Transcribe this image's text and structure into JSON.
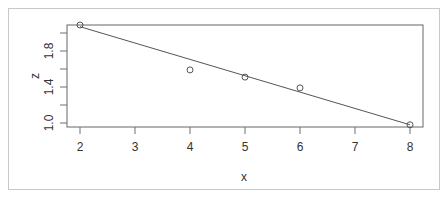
{
  "chart_data": {
    "type": "scatter",
    "title": "",
    "xlabel": "x",
    "ylabel": "z",
    "xlim": [
      1.76,
      8.24
    ],
    "ylim": [
      0.96,
      2.09
    ],
    "x_ticks": [
      2,
      3,
      4,
      5,
      6,
      7,
      8
    ],
    "x_tick_labels": [
      "2",
      "3",
      "4",
      "5",
      "6",
      "7",
      "8"
    ],
    "y_ticks": [
      1.0,
      1.2,
      1.4,
      1.6,
      1.8,
      2.0
    ],
    "y_tick_labels": [
      "1.0",
      "",
      "1.4",
      "",
      "1.8",
      ""
    ],
    "grid": false,
    "legend": null,
    "points": [
      {
        "x": 2,
        "z": 2.09
      },
      {
        "x": 4,
        "z": 1.59
      },
      {
        "x": 5,
        "z": 1.51
      },
      {
        "x": 6,
        "z": 1.39
      },
      {
        "x": 8,
        "z": 0.98
      }
    ],
    "fit_line": {
      "type": "linear",
      "x": [
        2,
        8
      ],
      "z": [
        2.07,
        0.98
      ]
    },
    "colors": {
      "points": "#555555",
      "line": "#555555",
      "box": "#666666"
    }
  },
  "plot": {
    "box": {
      "left": 67,
      "top": 25,
      "right": 423,
      "bottom": 127
    },
    "x_px": {
      "origin_value": 2,
      "origin_px": 80,
      "px_per_unit": 55
    },
    "y_px": {
      "origin_value": 1.0,
      "origin_px": 123,
      "px_per_unit": 90
    }
  }
}
